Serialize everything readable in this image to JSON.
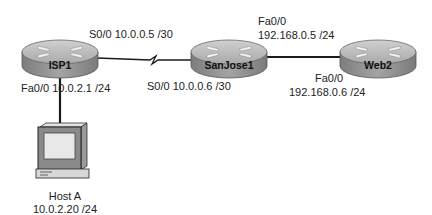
{
  "diagram": {
    "type": "network-topology",
    "devices": [
      {
        "id": "isp1",
        "kind": "router",
        "name": "ISP1"
      },
      {
        "id": "sanjose1",
        "kind": "router",
        "name": "SanJose1"
      },
      {
        "id": "web2",
        "kind": "router",
        "name": "Web2"
      },
      {
        "id": "hosta",
        "kind": "pc",
        "name": "Host A",
        "ip": "10.0.2.20 /24"
      }
    ],
    "labels": {
      "isp1_s00": "S0/0 10.0.0.5 /30",
      "isp1_fa00": "Fa0/0 10.0.2.1  /24",
      "sanjose1_s00": "S0/0 10.0.0.6 /30",
      "sanjose1_fa00_if": "Fa0/0",
      "sanjose1_fa00_ip": "192.168.0.5  /24",
      "web2_fa00_if": "Fa0/0",
      "web2_fa00_ip": "192.168.0.6  /24",
      "hosta_name": "Host A",
      "hosta_ip": "10.0.2.20 /24"
    },
    "links": [
      {
        "from": "isp1",
        "to": "sanjose1",
        "type": "serial"
      },
      {
        "from": "sanjose1",
        "to": "web2",
        "type": "ethernet"
      },
      {
        "from": "isp1",
        "to": "hosta",
        "type": "ethernet"
      }
    ],
    "colors": {
      "router_top": "#b9b9b9",
      "router_side": "#8f8f8f",
      "link": "#1a1a1a",
      "background": "#ffffff"
    }
  }
}
